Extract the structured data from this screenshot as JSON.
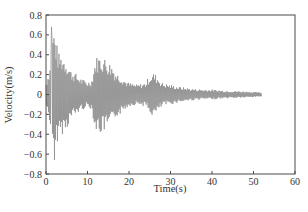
{
  "chart_data": {
    "type": "line",
    "title": "",
    "xlabel": "Time(s)",
    "ylabel": "Velocity(m/s)",
    "xlim": [
      0,
      60
    ],
    "ylim": [
      -0.8,
      0.8
    ],
    "xticks": [
      0,
      10,
      20,
      30,
      40,
      50,
      60
    ],
    "yticks": [
      0.8,
      0.6,
      0.4,
      0.2,
      0,
      -0.2,
      -0.4,
      -0.6,
      -0.8
    ],
    "ytick_labels": [
      "0.8",
      "0.6",
      "0.4",
      "0.2",
      "0",
      "−0.2",
      "−0.4",
      "−0.6",
      "−0.8"
    ],
    "grid": false,
    "legend": null,
    "line_color": "#8a8a8a",
    "axis_color": "#4a4a4a",
    "signal_end_s": 52,
    "peak_positive": {
      "t": 1.3,
      "v": 0.68
    },
    "peak_negative": {
      "t": 2.0,
      "v": -0.66
    },
    "envelope": [
      {
        "t": 0,
        "amp": 0.12
      },
      {
        "t": 1,
        "amp": 0.3
      },
      {
        "t": 1.3,
        "amp": 0.68
      },
      {
        "t": 2,
        "amp": 0.66
      },
      {
        "t": 3,
        "amp": 0.42
      },
      {
        "t": 4,
        "amp": 0.4
      },
      {
        "t": 5,
        "amp": 0.35
      },
      {
        "t": 6,
        "amp": 0.25
      },
      {
        "t": 7,
        "amp": 0.22
      },
      {
        "t": 8,
        "amp": 0.18
      },
      {
        "t": 9,
        "amp": 0.15
      },
      {
        "t": 10,
        "amp": 0.13
      },
      {
        "t": 11,
        "amp": 0.15
      },
      {
        "t": 12,
        "amp": 0.38
      },
      {
        "t": 13,
        "amp": 0.4
      },
      {
        "t": 14,
        "amp": 0.38
      },
      {
        "t": 15,
        "amp": 0.34
      },
      {
        "t": 16,
        "amp": 0.3
      },
      {
        "t": 17,
        "amp": 0.22
      },
      {
        "t": 18,
        "amp": 0.2
      },
      {
        "t": 19,
        "amp": 0.15
      },
      {
        "t": 20,
        "amp": 0.12
      },
      {
        "t": 22,
        "amp": 0.1
      },
      {
        "t": 24,
        "amp": 0.12
      },
      {
        "t": 25,
        "amp": 0.2
      },
      {
        "t": 26,
        "amp": 0.22
      },
      {
        "t": 27,
        "amp": 0.18
      },
      {
        "t": 28,
        "amp": 0.12
      },
      {
        "t": 30,
        "amp": 0.1
      },
      {
        "t": 32,
        "amp": 0.08
      },
      {
        "t": 35,
        "amp": 0.06
      },
      {
        "t": 38,
        "amp": 0.05
      },
      {
        "t": 40,
        "amp": 0.05
      },
      {
        "t": 43,
        "amp": 0.04
      },
      {
        "t": 46,
        "amp": 0.035
      },
      {
        "t": 49,
        "amp": 0.03
      },
      {
        "t": 52,
        "amp": 0.02
      }
    ]
  }
}
